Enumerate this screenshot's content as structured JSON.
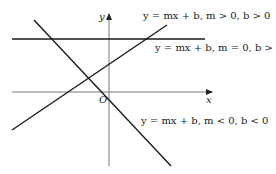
{
  "diagram": {
    "axes": {
      "x_label": "x",
      "y_label": "y",
      "origin_label": "O"
    },
    "lines": [
      {
        "id": "positive-slope",
        "label": "y = mx + b, m > 0, b > 0"
      },
      {
        "id": "zero-slope",
        "label": "y = mx + b, m = 0, b > 0"
      },
      {
        "id": "negative-slope",
        "label": "y = mx + b, m < 0, b < 0"
      }
    ],
    "colors": {
      "line": "#1a1a1a",
      "axis": "#777777",
      "background": "#ffffff"
    }
  }
}
